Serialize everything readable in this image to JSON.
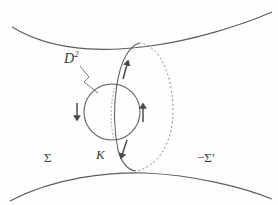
{
  "figure": {
    "type": "topology-diagram",
    "width": 278,
    "height": 205,
    "background_color": "#fefefe",
    "stroke_color": "#585858",
    "arrow_color": "#4a4a4a",
    "label_color": "#3a3a3a"
  },
  "labels": {
    "disk": "D",
    "disk_exponent": "2",
    "knot": "K",
    "surface_left": "Σ",
    "surface_right": "−Σ′"
  },
  "shapes": {
    "top_surface": {
      "name": "upper-surface-curve",
      "path": "M 12 27 C 60 56, 120 50, 150 46 C 190 41, 240 26, 272 12",
      "style": "solid"
    },
    "bottom_surface": {
      "name": "lower-surface-curve",
      "path": "M 10 201 C 55 177, 110 172, 145 173 C 195 175, 245 188, 272 199",
      "style": "solid"
    },
    "tube_ellipse_front": {
      "name": "tube-ellipse-front-arc",
      "path": "M 139 43 C 116 52, 110 110, 118 150 C 122 164, 128 170, 136 171",
      "style": "solid"
    },
    "tube_ellipse_back": {
      "name": "tube-ellipse-back-arc",
      "path": "M 139 43 C 160 45, 172 75, 173 107 C 174 142, 158 167, 136 171",
      "style": "dashed"
    },
    "disk_circle": {
      "name": "disk-circle",
      "cx": 112,
      "cy": 112,
      "r": 28,
      "style": "solid"
    },
    "hidden_arc": {
      "name": "hidden-back-arc",
      "path": "M 116 84 C 110 100, 110 126, 114 140",
      "style": "dashed"
    },
    "pointer_line": {
      "name": "disk-pointer-line",
      "path": "M 80 66 L 88 76 L 84 81 L 97 92",
      "style": "solid"
    }
  },
  "arrows": [
    {
      "name": "arrow-disk-left-down",
      "direction": "down",
      "x1": 77,
      "y1": 103,
      "x2": 77,
      "y2": 120
    },
    {
      "name": "arrow-disk-right-up",
      "direction": "up",
      "x1": 143,
      "y1": 122,
      "x2": 143,
      "y2": 103
    },
    {
      "name": "arrow-tube-upper-left",
      "direction": "up-right",
      "x1": 123,
      "y1": 78,
      "x2": 128,
      "y2": 60
    },
    {
      "name": "arrow-tube-lower-left",
      "direction": "down-left",
      "x1": 126,
      "y1": 140,
      "x2": 120,
      "y2": 158
    }
  ]
}
